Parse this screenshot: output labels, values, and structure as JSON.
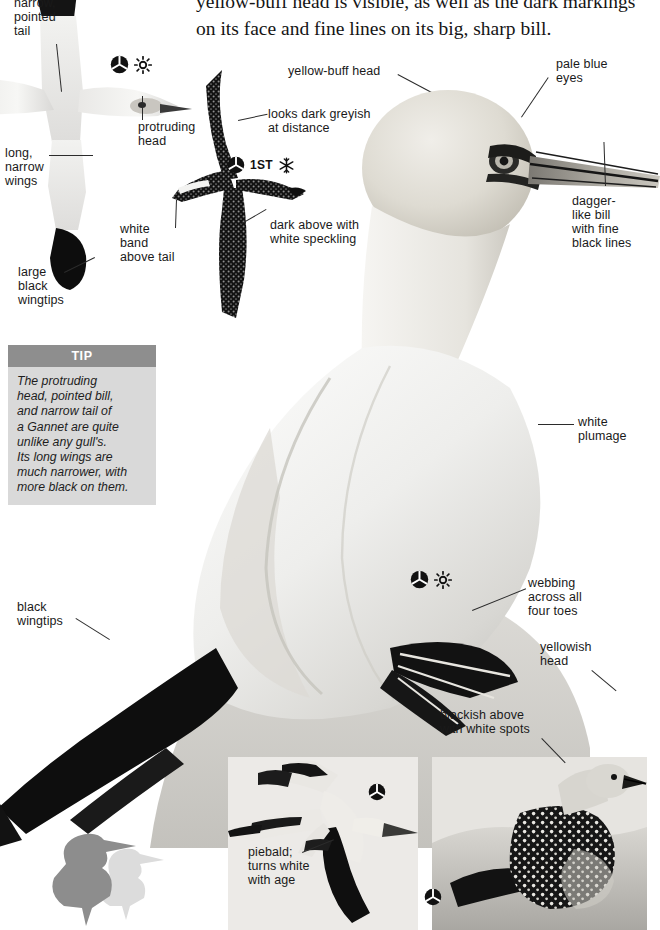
{
  "page": {
    "species": "Gannet",
    "background": "#ffffff",
    "width": 647,
    "height": 930
  },
  "intro_text": "yellow-buff head is visible, as well as the dark markings\non its face and fine lines on its big, sharp bill.",
  "tip": {
    "heading": "TIP",
    "body": "The protruding\nhead, pointed bill,\nand narrow tail of\na Gannet are quite\nunlike any gull's.\nIts long wings are\nmuch narrower, with\nmore black on them.",
    "header_color": "#8e8e8e",
    "body_color": "#d9d9d9"
  },
  "annotations": [
    {
      "id": "narrow-pointed-tail",
      "text": "narrow,\npointed\ntail",
      "x": 14,
      "y": -4
    },
    {
      "id": "long-narrow-wings",
      "text": "long,\nnarrow\nwings",
      "x": 5,
      "y": 146
    },
    {
      "id": "large-black-wingtips",
      "text": "large\nblack\nwingtips",
      "x": 18,
      "y": 265
    },
    {
      "id": "protruding-head",
      "text": "protruding\nhead",
      "x": 138,
      "y": 120
    },
    {
      "id": "white-band-above-tail",
      "text": "white\nband\nabove tail",
      "x": 120,
      "y": 222
    },
    {
      "id": "yellow-buff-head",
      "text": "yellow-buff head",
      "x": 288,
      "y": 64
    },
    {
      "id": "looks-dark-greyish",
      "text": "looks dark greyish\nat distance",
      "x": 268,
      "y": 107
    },
    {
      "id": "dark-above-speckling",
      "text": "dark above with\nwhite speckling",
      "x": 270,
      "y": 218
    },
    {
      "id": "pale-blue-eyes",
      "text": "pale blue\neyes",
      "x": 556,
      "y": 57
    },
    {
      "id": "dagger-like-bill",
      "text": "dagger-\nlike bill\nwith fine\nblack lines",
      "x": 572,
      "y": 194
    },
    {
      "id": "white-plumage",
      "text": "white\nplumage",
      "x": 578,
      "y": 415
    },
    {
      "id": "black-wingtips",
      "text": "black\nwingtips",
      "x": 17,
      "y": 600
    },
    {
      "id": "webbing-four-toes",
      "text": "webbing\nacross all\nfour toes",
      "x": 528,
      "y": 576
    },
    {
      "id": "yellowish-head",
      "text": "yellowish\nhead",
      "x": 540,
      "y": 640
    },
    {
      "id": "blackish-white-spots",
      "text": "blackish above\nwith white spots",
      "x": 440,
      "y": 708
    },
    {
      "id": "piebald-turns-white",
      "text": "piebald;\nturns white\nwith age",
      "x": 248,
      "y": 845
    }
  ],
  "icon_groups": [
    {
      "id": "adult-summer-flight",
      "x": 110,
      "y": 55,
      "icons": [
        "adult-plumage-icon",
        "summer-icon"
      ],
      "age_label": ""
    },
    {
      "id": "first-winter",
      "x": 227,
      "y": 156,
      "icons": [
        "adult-plumage-icon",
        "winter-icon"
      ],
      "age_label": "1ST"
    },
    {
      "id": "adult-summer-feet",
      "x": 410,
      "y": 570,
      "icons": [
        "adult-plumage-icon",
        "summer-icon"
      ],
      "age_label": ""
    },
    {
      "id": "immature-flight",
      "x": 368,
      "y": 783,
      "icons": [
        "adult-plumage-icon"
      ],
      "age_label": ""
    },
    {
      "id": "juvenile-perched",
      "x": 424,
      "y": 888,
      "icons": [
        "adult-plumage-icon"
      ],
      "age_label": ""
    }
  ],
  "icon_names": {
    "adult-plumage-icon": "filled circle with white tri-radial divider",
    "summer-icon": "sun with rays",
    "winter-icon": "snowflake"
  },
  "insets": [
    {
      "id": "inset-immature-flight",
      "x": 228,
      "y": 757,
      "w": 190,
      "h": 173,
      "bg": "#eceae7"
    },
    {
      "id": "inset-juvenile-perched",
      "x": 432,
      "y": 757,
      "w": 215,
      "h": 173,
      "bg": "#eceae7"
    }
  ],
  "silhouettes": [
    {
      "id": "silhouette-gannet-dark",
      "color": "#8d8d8d",
      "x": 62,
      "y": 828
    },
    {
      "id": "silhouette-gannet-light",
      "color": "#dcdcdc",
      "x": 110,
      "y": 852
    }
  ]
}
